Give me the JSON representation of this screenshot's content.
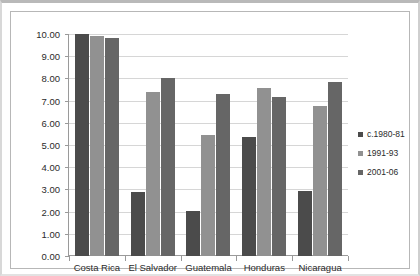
{
  "chart_data": {
    "type": "bar",
    "title": "",
    "xlabel": "",
    "ylabel": "",
    "ylim": [
      0,
      10
    ],
    "ytick_step": 1,
    "grid": "horizontal",
    "legend_position": "right",
    "categories": [
      "Costa Rica",
      "El Salvador",
      "Guatemala",
      "Honduras",
      "Nicaragua"
    ],
    "ytick_labels": [
      "10.00",
      "9.00",
      "8.00",
      "7.00",
      "6.00",
      "5.00",
      "4.00",
      "3.00",
      "2.00",
      "1.00",
      "0.00"
    ],
    "series": [
      {
        "name": "c.1980-81",
        "color": "#4b4b4b",
        "values": [
          10.0,
          2.9,
          2.05,
          5.35,
          2.95
        ]
      },
      {
        "name": "1991-93",
        "color": "#919191",
        "values": [
          9.9,
          7.4,
          5.45,
          7.55,
          6.75
        ]
      },
      {
        "name": "2001-06",
        "color": "#666666",
        "values": [
          9.8,
          8.0,
          7.3,
          7.15,
          7.85
        ]
      }
    ]
  }
}
